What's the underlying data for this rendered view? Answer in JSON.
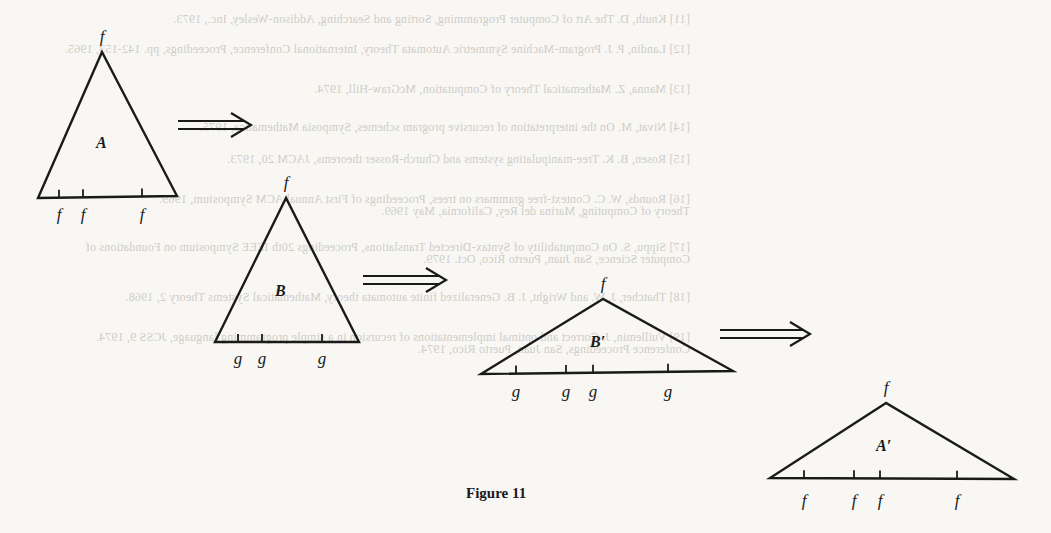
{
  "figure": {
    "caption": "Figure 11",
    "triangles": [
      {
        "id": "A",
        "label": "A",
        "apex_label": "f",
        "apex": [
          102,
          52
        ],
        "base_left": [
          38,
          198
        ],
        "base_right": [
          177,
          196
        ],
        "label_pos": [
          96,
          148
        ],
        "ticks": [
          59,
          83,
          142
        ],
        "tick_labels": [
          "f",
          "f",
          "f"
        ],
        "tick_label_y": 220
      },
      {
        "id": "B",
        "label": "B",
        "apex_label": "f",
        "apex": [
          286,
          198
        ],
        "base_left": [
          215,
          342
        ],
        "base_right": [
          359,
          342
        ],
        "label_pos": [
          275,
          296
        ],
        "ticks": [
          238,
          262,
          322
        ],
        "tick_labels": [
          "g",
          "g",
          "g"
        ],
        "tick_label_y": 364
      },
      {
        "id": "B-prime",
        "label": "B′",
        "apex_label": "f",
        "apex": [
          603,
          299
        ],
        "base_left": [
          481,
          374
        ],
        "base_right": [
          733,
          371
        ],
        "label_pos": [
          590,
          347
        ],
        "ticks": [
          516,
          566,
          593,
          668
        ],
        "tick_labels": [
          "g",
          "g",
          "g",
          "g"
        ],
        "tick_label_y": 397
      },
      {
        "id": "A-prime",
        "label": "A′",
        "apex_label": "f",
        "apex": [
          886,
          403
        ],
        "base_left": [
          770,
          478
        ],
        "base_right": [
          1014,
          479
        ],
        "label_pos": [
          876,
          451
        ],
        "ticks": [
          804,
          854,
          880,
          957
        ],
        "tick_labels": [
          "f",
          "f",
          "f",
          "f"
        ],
        "tick_label_y": 506
      }
    ],
    "arrows": [
      {
        "x1": 178,
        "x2": 251,
        "y": 125
      },
      {
        "x1": 363,
        "x2": 446,
        "y": 280
      },
      {
        "x1": 720,
        "x2": 810,
        "y": 334
      }
    ]
  },
  "bleed_text": [
    {
      "x": 690,
      "y": 12,
      "text": "[11]   Knuth, D. The Art of Computer Programming, Sorting and Searching, Addison-Wesley, Inc., 1973."
    },
    {
      "x": 690,
      "y": 42,
      "text": "[12]   Landin, P. J. Program-Machine Symmetric Automata Theory, International Conference, Proceedings, pp. 142-153, 1965."
    },
    {
      "x": 690,
      "y": 82,
      "text": "[13]   Manna, Z. Mathematical Theory of Computation, McGraw-Hill, 1974."
    },
    {
      "x": 690,
      "y": 120,
      "text": "[14]   Nivat, M. On the interpretation of recursive program schemes, Symposia Mathematica, 1975."
    },
    {
      "x": 690,
      "y": 152,
      "text": "[15]   Rosen, B. K. Tree-manipulating systems and Church-Rosser theorems, JACM 20, 1973."
    },
    {
      "x": 690,
      "y": 192,
      "text": "[16]   Rounds, W. C. Context-free grammars on trees, Proceedings of First Annual ACM Symposium, 1969."
    },
    {
      "x": 690,
      "y": 204,
      "text": "          Theory of Computing, Marina del Rey, California, May 1969."
    },
    {
      "x": 690,
      "y": 240,
      "text": "[17]   Sippu, S. On Computability of Syntax-Directed Translations, Proceedings 20th IEEE Symposium on Foundations of"
    },
    {
      "x": 690,
      "y": 252,
      "text": "          Computer Science, San Juan, Puerto Rico, Oct. 1979."
    },
    {
      "x": 690,
      "y": 290,
      "text": "[18]   Thatcher, J. W. and Wright, J. B. Generalized finite automata theory, Mathematical Systems Theory 2, 1968."
    },
    {
      "x": 690,
      "y": 330,
      "text": "[19]   Vuillemin, J. Correct and optimal implementations of recursion in a simple programming language, JCSS 9, 1974."
    },
    {
      "x": 690,
      "y": 342,
      "text": "          Conference Proceedings, San Juan, Puerto Rico, 1974."
    }
  ]
}
